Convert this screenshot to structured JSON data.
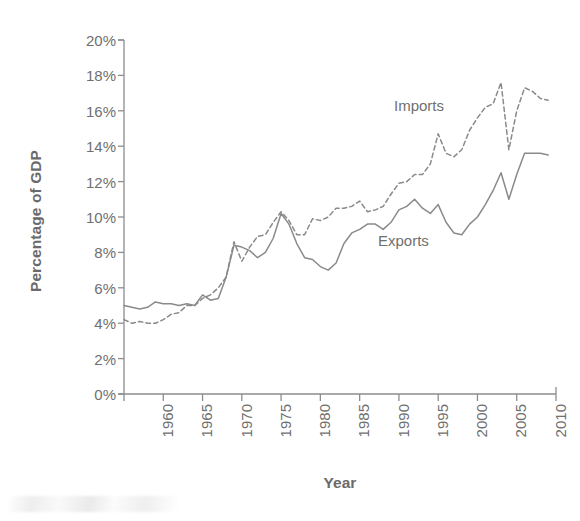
{
  "chart_data": {
    "type": "line",
    "title": "",
    "xlabel": "Year",
    "ylabel": "Percentage of GDP",
    "xlim": [
      1960,
      2015
    ],
    "ylim": [
      0,
      20
    ],
    "grid": false,
    "legend_position": "inline-annotation",
    "xticks": [
      "1960",
      "1965",
      "1970",
      "1975",
      "1980",
      "1985",
      "1990",
      "1995",
      "2000",
      "2005",
      "2010",
      "2015"
    ],
    "xtick_values": [
      1960,
      1965,
      1970,
      1975,
      1980,
      1985,
      1990,
      1995,
      2000,
      2005,
      2010,
      2015
    ],
    "yticks": [
      "0%",
      "2%",
      "4%",
      "6%",
      "8%",
      "10%",
      "12%",
      "14%",
      "16%",
      "18%",
      "20%"
    ],
    "ytick_values": [
      0,
      2,
      4,
      6,
      8,
      10,
      12,
      14,
      16,
      18,
      20
    ],
    "x": [
      1960,
      1961,
      1962,
      1963,
      1964,
      1965,
      1966,
      1967,
      1968,
      1969,
      1970,
      1971,
      1972,
      1973,
      1974,
      1975,
      1976,
      1977,
      1978,
      1979,
      1980,
      1981,
      1982,
      1983,
      1984,
      1985,
      1986,
      1987,
      1988,
      1989,
      1990,
      1991,
      1992,
      1993,
      1994,
      1995,
      1996,
      1997,
      1998,
      1999,
      2000,
      2001,
      2002,
      2003,
      2004,
      2005,
      2006,
      2007,
      2008,
      2009,
      2010,
      2011,
      2012,
      2013,
      2014
    ],
    "series": [
      {
        "name": "Imports",
        "style": "dashed",
        "color": "#8a8a8a",
        "values": [
          4.2,
          4.0,
          4.1,
          4.0,
          4.0,
          4.2,
          4.5,
          4.6,
          5.0,
          5.0,
          5.4,
          5.6,
          6.0,
          6.6,
          8.6,
          7.5,
          8.3,
          8.9,
          9.0,
          9.7,
          10.3,
          9.8,
          9.0,
          9.0,
          9.9,
          9.8,
          10.0,
          10.5,
          10.5,
          10.6,
          10.9,
          10.3,
          10.4,
          10.6,
          11.3,
          11.9,
          12.0,
          12.4,
          12.4,
          13.0,
          14.7,
          13.6,
          13.4,
          13.8,
          14.9,
          15.6,
          16.2,
          16.4,
          17.6,
          13.8,
          16.0,
          17.3,
          17.1,
          16.7,
          16.6
        ]
      },
      {
        "name": "Exports",
        "style": "solid",
        "color": "#8a8a8a",
        "values": [
          5.0,
          4.9,
          4.8,
          4.9,
          5.2,
          5.1,
          5.1,
          5.0,
          5.1,
          5.0,
          5.6,
          5.3,
          5.4,
          6.6,
          8.4,
          8.3,
          8.1,
          7.7,
          8.0,
          8.8,
          10.2,
          9.6,
          8.5,
          7.7,
          7.6,
          7.2,
          7.0,
          7.4,
          8.5,
          9.1,
          9.3,
          9.6,
          9.6,
          9.3,
          9.7,
          10.4,
          10.6,
          11.0,
          10.5,
          10.2,
          10.7,
          9.7,
          9.1,
          9.0,
          9.6,
          10.0,
          10.7,
          11.5,
          12.5,
          11.0,
          12.4,
          13.6,
          13.6,
          13.6,
          13.5
        ]
      }
    ],
    "annotations": [
      {
        "name": "imports-label",
        "text": "Imports"
      },
      {
        "name": "exports-label",
        "text": "Exports"
      }
    ]
  },
  "axes": {
    "y_title": "Percentage of GDP",
    "x_title": "Year"
  }
}
